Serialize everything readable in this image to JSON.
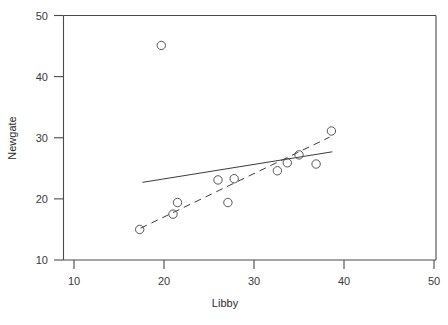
{
  "chart_data": {
    "type": "scatter",
    "title": "",
    "xlabel": "Libby",
    "ylabel": "Newgate",
    "xlim": [
      10,
      50
    ],
    "ylim": [
      10,
      50
    ],
    "xticks": [
      10,
      20,
      30,
      40,
      50
    ],
    "yticks": [
      10,
      20,
      30,
      40,
      50
    ],
    "xtick_labels": [
      "10",
      "20",
      "30",
      "40",
      "50"
    ],
    "ytick_labels": [
      "10",
      "20",
      "30",
      "40",
      "50"
    ],
    "grid": false,
    "legend": "none",
    "marker": "open-circle",
    "points": [
      {
        "x": 17.3,
        "y": 15.0
      },
      {
        "x": 19.7,
        "y": 45.1
      },
      {
        "x": 21.0,
        "y": 17.5
      },
      {
        "x": 21.5,
        "y": 19.4
      },
      {
        "x": 26.0,
        "y": 23.1
      },
      {
        "x": 27.1,
        "y": 19.4
      },
      {
        "x": 27.8,
        "y": 23.3
      },
      {
        "x": 32.6,
        "y": 24.6
      },
      {
        "x": 33.7,
        "y": 25.9
      },
      {
        "x": 35.0,
        "y": 27.2
      },
      {
        "x": 36.9,
        "y": 25.7
      },
      {
        "x": 38.6,
        "y": 31.1
      }
    ],
    "series": [
      {
        "name": "ordinary-least-squares-fit",
        "style": "solid",
        "x": [
          17.6,
          38.7
        ],
        "y": [
          22.7,
          27.7
        ]
      },
      {
        "name": "robust-resistant-fit",
        "style": "dashed",
        "x": [
          17.4,
          38.4
        ],
        "y": [
          15.2,
          30.1
        ]
      }
    ]
  },
  "axes": {
    "x_title": "Libby",
    "y_title": "Newgate"
  }
}
